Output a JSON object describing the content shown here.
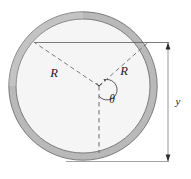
{
  "figure": {
    "labels": {
      "radius_left": "R",
      "radius_right": "R",
      "angle": "θ",
      "dimension_vertical": "y"
    },
    "colors": {
      "ring_fill": "#b9b9b9",
      "ring_outline": "#6e6e6e",
      "interior_fill": "#f5f5f5",
      "line": "#3b3b3b",
      "dashed_line": "#6b6b6b",
      "dimension_line": "#8a8a8a",
      "background": "#ffffff"
    },
    "geometry": {
      "center_x": 83,
      "center_y": 86,
      "outer_radius": 75,
      "inner_radius": 68,
      "apex_x": 99,
      "apex_y": 86,
      "chord_y": 42,
      "chord_left_x": 34,
      "chord_right_x": 148,
      "angle_label_degrees": "θ"
    }
  }
}
